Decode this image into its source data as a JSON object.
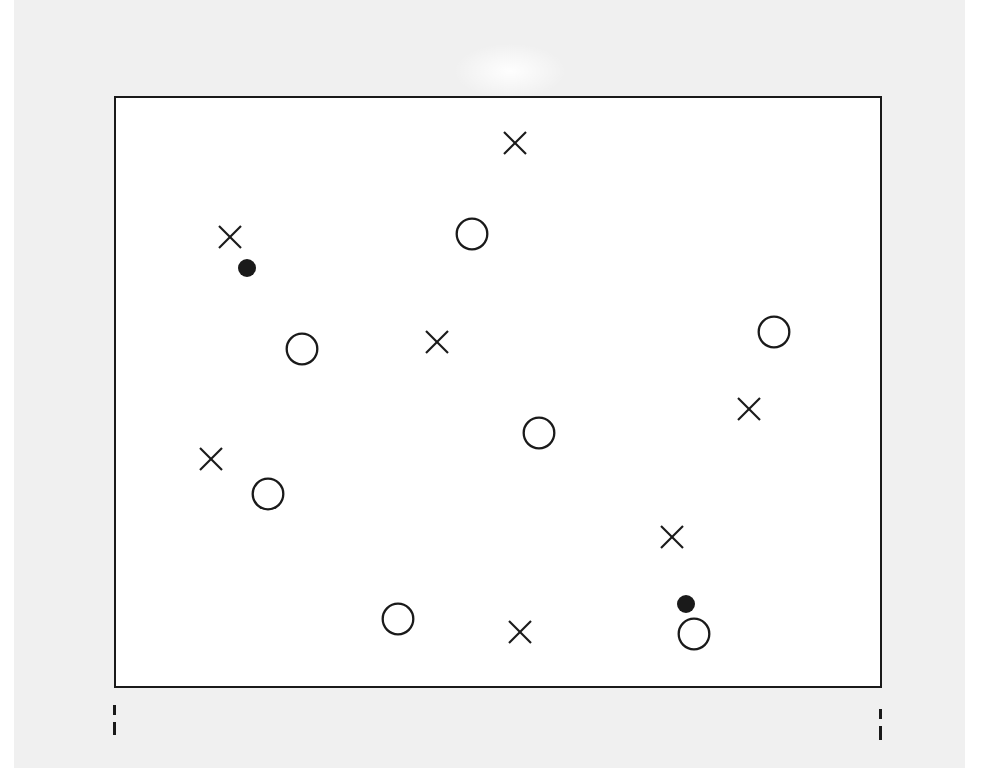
{
  "figure": {
    "title": "",
    "caption": "",
    "background_color": "#f0f0f0",
    "plot_background_color": "#ffffff",
    "frame_color": "#1a1a1a",
    "marker_color": "#1a1a1a"
  },
  "axes": {
    "x_ticks": [
      "",
      ""
    ],
    "y_ticks": [],
    "xlabel": "",
    "ylabel": "",
    "grid": false,
    "frame_bounds_px": {
      "left": 114,
      "top": 96,
      "right": 882,
      "bottom": 688
    }
  },
  "legend": {
    "visible": false,
    "entries": [
      {
        "name": "open-circle",
        "label": ""
      },
      {
        "name": "cross",
        "label": ""
      },
      {
        "name": "filled-circle",
        "label": ""
      }
    ]
  },
  "chart_data": {
    "type": "scatter",
    "title": "",
    "subtitle": "",
    "xlabel": "",
    "ylabel": "",
    "xlim": [
      0,
      100
    ],
    "ylim": [
      0,
      100
    ],
    "grid": false,
    "legend_position": "none",
    "axis_ticks_x": [
      "",
      ""
    ],
    "axis_ticks_y": [],
    "series": [
      {
        "name": "open circle",
        "marker": "o",
        "filled": false,
        "size_px": 33,
        "points": [
          {
            "x": 46.4,
            "y": 77.0
          },
          {
            "x": 24.2,
            "y": 57.6
          },
          {
            "x": 85.7,
            "y": 60.5
          },
          {
            "x": 55.1,
            "y": 43.4
          },
          {
            "x": 19.8,
            "y": 33.1
          },
          {
            "x": 36.7,
            "y": 12.0
          },
          {
            "x": 75.3,
            "y": 9.5
          }
        ]
      },
      {
        "name": "cross",
        "marker": "x",
        "filled": false,
        "size_px": 22,
        "points": [
          {
            "x": 51.9,
            "y": 92.4
          },
          {
            "x": 14.8,
            "y": 76.5
          },
          {
            "x": 41.8,
            "y": 58.8
          },
          {
            "x": 82.4,
            "y": 47.5
          },
          {
            "x": 12.4,
            "y": 39.0
          },
          {
            "x": 72.4,
            "y": 25.8
          },
          {
            "x": 52.6,
            "y": 9.8
          }
        ]
      },
      {
        "name": "filled circle",
        "marker": "o",
        "filled": true,
        "size_px": 18,
        "points": [
          {
            "x": 17.1,
            "y": 71.3
          },
          {
            "x": 74.2,
            "y": 14.5
          }
        ]
      }
    ],
    "points_px": [
      {
        "series": "open circle",
        "cx": 470,
        "cy": 232
      },
      {
        "series": "open circle",
        "cx": 300,
        "cy": 347
      },
      {
        "series": "open circle",
        "cx": 772,
        "cy": 330
      },
      {
        "series": "open circle",
        "cx": 537,
        "cy": 431
      },
      {
        "series": "open circle",
        "cx": 266,
        "cy": 492
      },
      {
        "series": "open circle",
        "cx": 396,
        "cy": 617
      },
      {
        "series": "open circle",
        "cx": 692,
        "cy": 632
      },
      {
        "series": "cross",
        "cx": 513,
        "cy": 141
      },
      {
        "series": "cross",
        "cx": 228,
        "cy": 235
      },
      {
        "series": "cross",
        "cx": 435,
        "cy": 340
      },
      {
        "series": "cross",
        "cx": 747,
        "cy": 407
      },
      {
        "series": "cross",
        "cx": 209,
        "cy": 457
      },
      {
        "series": "cross",
        "cx": 670,
        "cy": 535
      },
      {
        "series": "cross",
        "cx": 518,
        "cy": 630
      },
      {
        "series": "filled circle",
        "cx": 245,
        "cy": 266
      },
      {
        "series": "filled circle",
        "cx": 684,
        "cy": 602
      }
    ],
    "counts": {
      "open_circle": 7,
      "cross": 7,
      "filled_circle": 2,
      "total": 16
    }
  }
}
